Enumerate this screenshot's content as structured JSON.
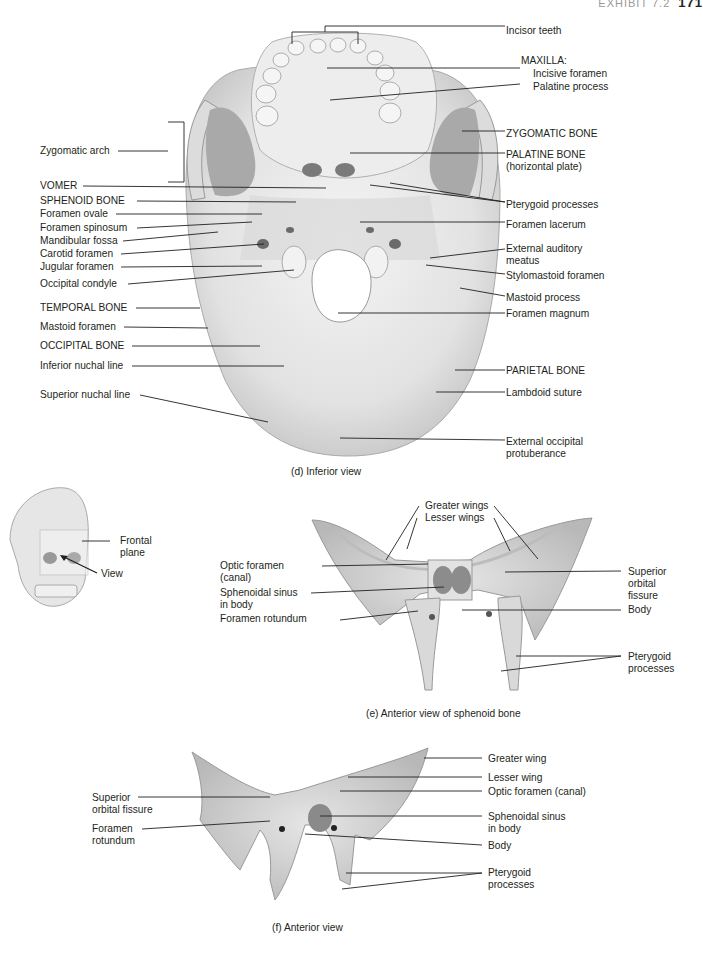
{
  "header": {
    "exhibit": "EXHIBIT 7.2",
    "page_number": "171"
  },
  "figure_d": {
    "caption": "(d) Inferior view",
    "right_labels": [
      {
        "text": "Incisor teeth"
      },
      {
        "text": "MAXILLA:"
      },
      {
        "text": "Incisive foramen"
      },
      {
        "text": "Palatine process"
      },
      {
        "text": "ZYGOMATIC BONE"
      },
      {
        "text": "PALATINE BONE",
        "line2": "(horizontal plate)"
      },
      {
        "text": "Pterygoid processes"
      },
      {
        "text": "Foramen lacerum"
      },
      {
        "text": "External auditory",
        "line2": "meatus"
      },
      {
        "text": "Stylomastoid foramen"
      },
      {
        "text": "Mastoid process"
      },
      {
        "text": "Foramen magnum"
      },
      {
        "text": "PARIETAL BONE"
      },
      {
        "text": "Lambdoid suture"
      },
      {
        "text": "External occipital",
        "line2": "protuberance"
      }
    ],
    "left_labels": [
      {
        "text": "Zygomatic arch"
      },
      {
        "text": "VOMER"
      },
      {
        "text": "SPHENOID BONE"
      },
      {
        "text": "Foramen ovale"
      },
      {
        "text": "Foramen spinosum"
      },
      {
        "text": "Mandibular fossa"
      },
      {
        "text": "Carotid foramen"
      },
      {
        "text": "Jugular foramen"
      },
      {
        "text": "Occipital condyle"
      },
      {
        "text": "TEMPORAL BONE"
      },
      {
        "text": "Mastoid foramen"
      },
      {
        "text": "OCCIPITAL BONE"
      },
      {
        "text": "Inferior nuchal line"
      },
      {
        "text": "Superior nuchal line"
      }
    ]
  },
  "orientation_skull": {
    "labels": [
      {
        "text": "Frontal",
        "line2": "plane"
      },
      {
        "text": "View"
      }
    ]
  },
  "figure_e": {
    "caption": "(e) Anterior view of sphenoid bone",
    "top_labels": [
      {
        "text": "Greater wings"
      },
      {
        "text": "Lesser wings"
      }
    ],
    "left_labels": [
      {
        "text": "Optic foramen",
        "line2": "(canal)"
      },
      {
        "text": "Sphenoidal sinus",
        "line2": "in body"
      },
      {
        "text": "Foramen rotundum"
      }
    ],
    "right_labels": [
      {
        "text": "Superior",
        "line2": "orbital",
        "line3": "fissure"
      },
      {
        "text": "Body"
      },
      {
        "text": "Pterygoid",
        "line2": "processes"
      }
    ]
  },
  "figure_f": {
    "caption": "(f) Anterior view",
    "left_labels": [
      {
        "text": "Superior",
        "line2": "orbital fissure"
      },
      {
        "text": "Foramen",
        "line2": "rotundum"
      }
    ],
    "right_labels": [
      {
        "text": "Greater wing"
      },
      {
        "text": "Lesser wing"
      },
      {
        "text": "Optic foramen (canal)"
      },
      {
        "text": "Sphenoidal sinus",
        "line2": "in body"
      },
      {
        "text": "Body"
      },
      {
        "text": "Pterygoid",
        "line2": "processes"
      }
    ]
  },
  "colors": {
    "bone_light": "#ececec",
    "bone_mid": "#cfcfcf",
    "bone_dark": "#9a9a9a",
    "text": "#231f20"
  }
}
